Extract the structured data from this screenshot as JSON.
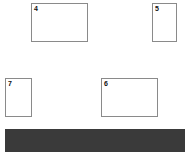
{
  "page": {
    "background_color": "#ffffff",
    "width": 192,
    "height": 152
  },
  "style": {
    "box_border_color": "#8a8a8a",
    "box_fill_color": "#ffffff",
    "label_color": "#111111",
    "bar_color": "#3a3a3a"
  },
  "regions": [
    {
      "label": "4",
      "name": "region-box-4",
      "x": 31,
      "y": 3,
      "width": 57,
      "height": 39,
      "orientation": "landscape"
    },
    {
      "label": "5",
      "name": "region-box-5",
      "x": 152,
      "y": 3,
      "width": 25,
      "height": 39,
      "orientation": "portrait"
    },
    {
      "label": "7",
      "name": "region-box-7",
      "x": 5,
      "y": 78,
      "width": 27,
      "height": 39,
      "orientation": "portrait"
    },
    {
      "label": "6",
      "name": "region-box-6",
      "x": 101,
      "y": 78,
      "width": 57,
      "height": 39,
      "orientation": "landscape"
    }
  ],
  "bar": {
    "name": "solid-bar",
    "x": 5,
    "y": 129,
    "width": 180,
    "height": 23,
    "color": "#3a3a3a"
  }
}
